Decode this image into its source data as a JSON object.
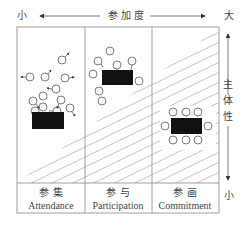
{
  "top_axis": {
    "left_label": "小",
    "center_label": "参 加 度",
    "right_label": "大"
  },
  "right_axis": {
    "top_label": "",
    "center_label": "主体性",
    "bottom_label": "小"
  },
  "columns": [
    {
      "cn": "参  集",
      "en": "Attendance"
    },
    {
      "cn": "参  与",
      "en": "Participation"
    },
    {
      "cn": "参  画",
      "en": "Commitment"
    }
  ],
  "colors": {
    "line": "#888888",
    "box": "#111111",
    "hatch": "#999999"
  }
}
